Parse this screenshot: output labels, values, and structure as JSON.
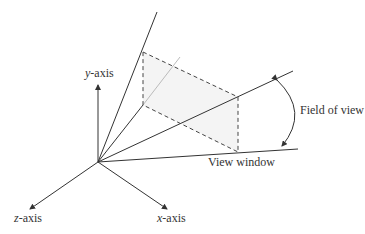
{
  "diagram": {
    "labels": {
      "y_axis": {
        "var": "y",
        "suffix": "-axis"
      },
      "z_axis": {
        "var": "z",
        "suffix": "-axis"
      },
      "x_axis": {
        "var": "x",
        "suffix": "-axis"
      },
      "field_of_view": "Field of view",
      "view_window": "View window"
    },
    "colors": {
      "line": "#333333",
      "dashed": "#444444",
      "fill": "#f4f4f4",
      "gray_line": "#bbbbbb"
    }
  }
}
